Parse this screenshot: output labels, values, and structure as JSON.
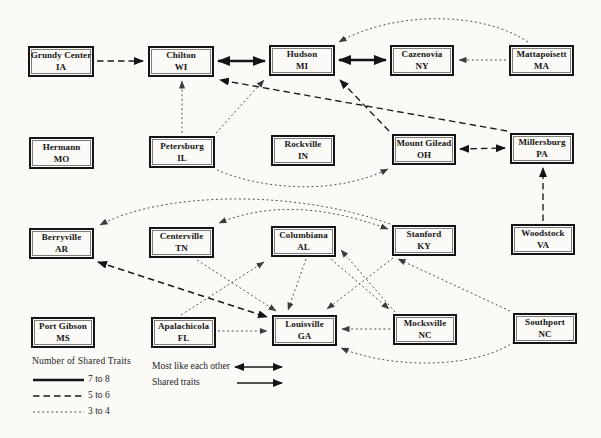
{
  "colors": {
    "ink": "#141414",
    "background": "#fbfaf7",
    "dotted_gray": "#4a4a4a"
  },
  "legend": {
    "traits_title": "Number of Shared Traits",
    "items": [
      {
        "label": "7 to 8",
        "style": "thick-solid"
      },
      {
        "label": "5 to 6",
        "style": "dashed"
      },
      {
        "label": "3 to 4",
        "style": "dotted"
      }
    ],
    "most_like_label": "Most like each other",
    "shared_label": "Shared traits"
  },
  "graph": {
    "nodes": [
      {
        "id": "grundy-center",
        "city": "Grundy Center",
        "state": "IA",
        "x": 28,
        "y": 46,
        "w": 66,
        "h": 31
      },
      {
        "id": "chilton",
        "city": "Chilton",
        "state": "WI",
        "x": 148,
        "y": 46,
        "w": 66,
        "h": 31
      },
      {
        "id": "hudson",
        "city": "Hudson",
        "state": "MI",
        "x": 269,
        "y": 45,
        "w": 66,
        "h": 31
      },
      {
        "id": "cazenovia",
        "city": "Cazenovia",
        "state": "NY",
        "x": 390,
        "y": 45,
        "w": 64,
        "h": 31
      },
      {
        "id": "mattapoisett",
        "city": "Mattapoisett",
        "state": "MA",
        "x": 509,
        "y": 45,
        "w": 65,
        "h": 31
      },
      {
        "id": "hermann",
        "city": "Hermann",
        "state": "MO",
        "x": 29,
        "y": 137,
        "w": 65,
        "h": 32
      },
      {
        "id": "petersburg",
        "city": "Petersburg",
        "state": "IL",
        "x": 149,
        "y": 136,
        "w": 66,
        "h": 32
      },
      {
        "id": "rockville",
        "city": "Rockville",
        "state": "IN",
        "x": 271,
        "y": 135,
        "w": 64,
        "h": 31
      },
      {
        "id": "mount-gilead",
        "city": "Mount Gilead",
        "state": "OH",
        "x": 392,
        "y": 134,
        "w": 64,
        "h": 31
      },
      {
        "id": "millersburg",
        "city": "Millersburg",
        "state": "PA",
        "x": 510,
        "y": 133,
        "w": 64,
        "h": 31
      },
      {
        "id": "berryville",
        "city": "Berryville",
        "state": "AR",
        "x": 29,
        "y": 228,
        "w": 65,
        "h": 31
      },
      {
        "id": "centerville",
        "city": "Centerville",
        "state": "TN",
        "x": 149,
        "y": 227,
        "w": 65,
        "h": 31
      },
      {
        "id": "columbiana",
        "city": "Columbiana",
        "state": "AL",
        "x": 271,
        "y": 226,
        "w": 65,
        "h": 31
      },
      {
        "id": "stanford",
        "city": "Stanford",
        "state": "KY",
        "x": 392,
        "y": 225,
        "w": 64,
        "h": 31
      },
      {
        "id": "woodstock",
        "city": "Woodstock",
        "state": "VA",
        "x": 511,
        "y": 224,
        "w": 64,
        "h": 31
      },
      {
        "id": "port-gibson",
        "city": "Port Gibson",
        "state": "MS",
        "x": 31,
        "y": 317,
        "w": 64,
        "h": 31
      },
      {
        "id": "apalachicola",
        "city": "Apalachicola",
        "state": "FL",
        "x": 151,
        "y": 317,
        "w": 65,
        "h": 31
      },
      {
        "id": "louisville",
        "city": "Louisville",
        "state": "GA",
        "x": 272,
        "y": 315,
        "w": 65,
        "h": 31
      },
      {
        "id": "mocksville",
        "city": "Mocksville",
        "state": "NC",
        "x": 393,
        "y": 314,
        "w": 64,
        "h": 31
      },
      {
        "id": "southport",
        "city": "Southport",
        "state": "NC",
        "x": 513,
        "y": 313,
        "w": 64,
        "h": 31
      }
    ],
    "edges": [
      {
        "from": "chilton",
        "to": "hudson",
        "weight": "7-8",
        "dir": "both",
        "path": "M 218,61 L 265,61"
      },
      {
        "from": "hudson",
        "to": "cazenovia",
        "weight": "7-8",
        "dir": "both",
        "path": "M 339,60 L 386,60"
      },
      {
        "from": "grundy-center",
        "to": "chilton",
        "weight": "5-6",
        "dir": "one",
        "path": "M 97,61 L 143,61"
      },
      {
        "from": "mount-gilead",
        "to": "millersburg",
        "weight": "5-6",
        "dir": "both",
        "path": "M 460,149 L 505,148"
      },
      {
        "from": "mount-gilead",
        "to": "hudson",
        "weight": "5-6",
        "dir": "one",
        "path": "M 389,131 L 340,80"
      },
      {
        "from": "millersburg",
        "to": "chilton",
        "weight": "5-6",
        "dir": "one",
        "path": "M 507,131 L 220,80"
      },
      {
        "from": "woodstock",
        "to": "millersburg",
        "weight": "5-6",
        "dir": "one",
        "path": "M 543,221 L 543,168"
      },
      {
        "from": "berryville",
        "to": "louisville",
        "weight": "5-6",
        "dir": "both",
        "path": "M 98,262 L 267,317"
      },
      {
        "from": "mattapoisett",
        "to": "cazenovia",
        "weight": "3-4",
        "dir": "one",
        "path": "M 506,60 L 459,60"
      },
      {
        "from": "mattapoisett",
        "to": "hudson",
        "weight": "3-4",
        "dir": "one",
        "path": "M 528,42 C 480,10 392,12 339,42"
      },
      {
        "from": "petersburg",
        "to": "chilton",
        "weight": "3-4",
        "dir": "one",
        "path": "M 182,133 L 182,81"
      },
      {
        "from": "petersburg",
        "to": "hudson",
        "weight": "3-4",
        "dir": "one",
        "path": "M 216,133 L 264,80"
      },
      {
        "from": "petersburg",
        "to": "mount-gilead",
        "weight": "3-4",
        "dir": "one",
        "path": "M 217,170 C 270,192 340,193 388,169"
      },
      {
        "from": "stanford",
        "to": "berryville",
        "weight": "3-4",
        "dir": "one",
        "path": "M 390,224 C 290,188 160,193 100,225"
      },
      {
        "from": "stanford",
        "to": "centerville",
        "weight": "3-4",
        "dir": "both",
        "path": "M 388,229 C 320,204 265,204 219,223"
      },
      {
        "from": "apalachicola",
        "to": "columbiana",
        "weight": "3-4",
        "dir": "one",
        "path": "M 181,315 L 264,262"
      },
      {
        "from": "apalachicola",
        "to": "louisville",
        "weight": "3-4",
        "dir": "one",
        "path": "M 218,331 L 267,331"
      },
      {
        "from": "centerville",
        "to": "louisville",
        "weight": "3-4",
        "dir": "one",
        "path": "M 197,260 L 276,311"
      },
      {
        "from": "columbiana",
        "to": "louisville",
        "weight": "3-4",
        "dir": "one",
        "path": "M 306,259 L 288,310"
      },
      {
        "from": "stanford",
        "to": "louisville",
        "weight": "3-4",
        "dir": "one",
        "path": "M 393,258 L 327,309"
      },
      {
        "from": "columbiana",
        "to": "mocksville",
        "weight": "3-4",
        "dir": "one",
        "path": "M 331,259 L 389,309"
      },
      {
        "from": "mocksville",
        "to": "columbiana",
        "weight": "3-4",
        "dir": "one",
        "path": "M 395,312 L 341,250"
      },
      {
        "from": "mocksville",
        "to": "louisville",
        "weight": "3-4",
        "dir": "one",
        "path": "M 390,329 L 342,329"
      },
      {
        "from": "southport",
        "to": "louisville",
        "weight": "3-4",
        "dir": "one",
        "path": "M 514,342 C 470,371 385,367 341,348"
      },
      {
        "from": "southport",
        "to": "stanford",
        "weight": "3-4",
        "dir": "one",
        "path": "M 510,311 L 398,259"
      }
    ]
  }
}
